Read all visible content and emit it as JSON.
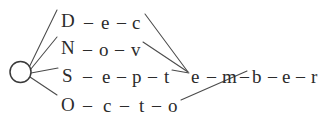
{
  "diagram": {
    "type": "word-lattice",
    "canvas": {
      "width": 327,
      "height": 127,
      "background": "#ffffff"
    },
    "colors": {
      "ink": "#2b2b2b",
      "edge": "#4a4a4a",
      "node_stroke": "#3a3a3a",
      "node_fill": "#ffffff"
    },
    "start_node": {
      "label": "start-node",
      "shape": "circle",
      "cx": 20.5,
      "cy": 72,
      "r": 10.5
    },
    "separator": "–",
    "branches": [
      {
        "id": "dec",
        "word": "Dec",
        "letters": [
          {
            "char": "D",
            "x": 61,
            "y": 11
          },
          {
            "char": "–",
            "x": 84,
            "y": 13
          },
          {
            "char": "e",
            "x": 101,
            "y": 13
          },
          {
            "char": "–",
            "x": 117,
            "y": 13
          },
          {
            "char": "c",
            "x": 132,
            "y": 13
          }
        ]
      },
      {
        "id": "nov",
        "word": "Nov",
        "letters": [
          {
            "char": "N",
            "x": 61,
            "y": 38
          },
          {
            "char": "–",
            "x": 83,
            "y": 40
          },
          {
            "char": "o",
            "x": 99,
            "y": 40
          },
          {
            "char": "–",
            "x": 115,
            "y": 40
          },
          {
            "char": "v",
            "x": 131,
            "y": 40
          }
        ]
      },
      {
        "id": "sept",
        "word": "Sept",
        "letters": [
          {
            "char": "S",
            "x": 62,
            "y": 66
          },
          {
            "char": "–",
            "x": 83,
            "y": 67
          },
          {
            "char": "e",
            "x": 102,
            "y": 67
          },
          {
            "char": "–",
            "x": 117,
            "y": 67
          },
          {
            "char": "p",
            "x": 132,
            "y": 67
          },
          {
            "char": "–",
            "x": 148,
            "y": 67
          },
          {
            "char": "t",
            "x": 164,
            "y": 67
          }
        ]
      },
      {
        "id": "octo",
        "word": "Octo",
        "letters": [
          {
            "char": "O",
            "x": 61,
            "y": 95
          },
          {
            "char": "–",
            "x": 83,
            "y": 96
          },
          {
            "char": "c",
            "x": 103,
            "y": 96
          },
          {
            "char": "–",
            "x": 120,
            "y": 96
          },
          {
            "char": "t",
            "x": 139,
            "y": 96
          },
          {
            "char": "–",
            "x": 152,
            "y": 96
          },
          {
            "char": "o",
            "x": 168,
            "y": 96
          }
        ]
      }
    ],
    "shared_suffix": {
      "id": "ember",
      "word": "ember",
      "letters": [
        {
          "char": "e",
          "x": 191,
          "y": 67
        },
        {
          "char": "–",
          "x": 207,
          "y": 67
        },
        {
          "char": "m",
          "x": 222,
          "y": 67
        },
        {
          "char": "–",
          "x": 240,
          "y": 67
        },
        {
          "char": "b",
          "x": 252,
          "y": 67
        },
        {
          "char": "–",
          "x": 268,
          "y": 67
        },
        {
          "char": "e",
          "x": 282,
          "y": 67
        },
        {
          "char": "–",
          "x": 296,
          "y": 67
        },
        {
          "char": "r",
          "x": 311,
          "y": 67
        }
      ]
    },
    "edges": [
      {
        "id": "start-to-dec",
        "from": "start-node",
        "to": "dec",
        "x1": 29.5,
        "y1": 66.5,
        "x2": 57,
        "y2": 10
      },
      {
        "id": "start-to-nov",
        "from": "start-node",
        "to": "nov",
        "x1": 30.5,
        "y1": 69.5,
        "x2": 57,
        "y2": 37
      },
      {
        "id": "start-to-sept",
        "from": "start-node",
        "to": "sept",
        "x1": 31,
        "y1": 73,
        "x2": 58,
        "y2": 68
      },
      {
        "id": "start-to-octo",
        "from": "start-node",
        "to": "octo",
        "x1": 30,
        "y1": 77,
        "x2": 57,
        "y2": 95
      },
      {
        "id": "dec-to-ember",
        "from": "dec",
        "to": "ember",
        "x1": 145,
        "y1": 14,
        "x2": 188,
        "y2": 72
      },
      {
        "id": "nov-to-ember",
        "from": "nov",
        "to": "ember",
        "x1": 143,
        "y1": 42,
        "x2": 188,
        "y2": 72
      },
      {
        "id": "sept-to-ember",
        "from": "sept",
        "to": "ember",
        "x1": 172,
        "y1": 70,
        "x2": 189,
        "y2": 73
      },
      {
        "id": "octo-to-ember",
        "from": "octo",
        "to": "ember",
        "x1": 181,
        "y1": 100,
        "x2": 247,
        "y2": 71
      }
    ]
  }
}
